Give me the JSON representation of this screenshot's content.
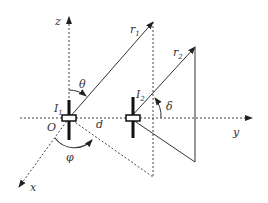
{
  "diagram": {
    "type": "two-dipole geometry",
    "axes": {
      "x": "x",
      "y": "y",
      "z": "z",
      "origin": "O"
    },
    "elements": {
      "dipole1": {
        "label": "I",
        "subscript": "1"
      },
      "dipole2": {
        "label": "I",
        "subscript": "2"
      },
      "ray1": {
        "label": "r",
        "subscript": "1"
      },
      "ray2": {
        "label": "r",
        "subscript": "2"
      },
      "separation": "d"
    },
    "angles": {
      "theta": "θ",
      "phi": "φ",
      "delta": "δ"
    },
    "colors": {
      "line": "#333333",
      "background": "#ffffff"
    }
  }
}
